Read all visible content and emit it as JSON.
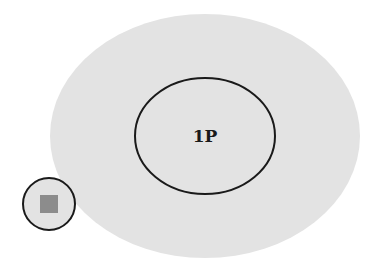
{
  "diagram": {
    "outer_region": {
      "fill": "#e3e3e3"
    },
    "inner_ellipse": {
      "label": "1P",
      "stroke": "#1a1a1a"
    },
    "outside_circle": {
      "stroke": "#1a1a1a",
      "fill": "#e3e3e3"
    },
    "square": {
      "fill": "#8c8c8c"
    }
  }
}
